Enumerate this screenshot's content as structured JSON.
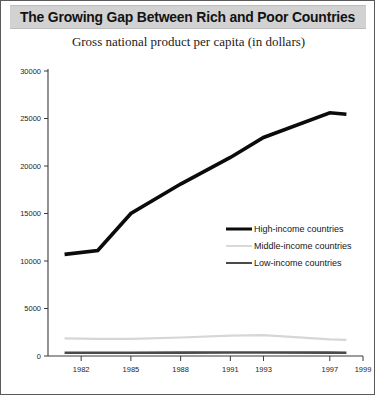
{
  "figure": {
    "title": "The Growing Gap Between Rich and Poor Countries",
    "subtitle": "Gross national product per capita (in dollars)"
  },
  "colors": {
    "title_band": "#d2d2d2",
    "frame": "#5a5a5a",
    "high_income": "#0b0b0b",
    "middle_income": "#d6d6d6",
    "low_income": "#4a4a4a"
  },
  "chart_data": {
    "type": "line",
    "title": "The Growing Gap Between Rich and Poor Countries",
    "subtitle": "Gross national product per capita (in dollars)",
    "xlabel": "",
    "ylabel": "",
    "xlim": [
      1980,
      1999
    ],
    "ylim": [
      0,
      30000
    ],
    "ytick_labels": [
      "0",
      "5000",
      "10000",
      "15000",
      "20000",
      "25000",
      "30000"
    ],
    "yticks": [
      0,
      5000,
      10000,
      15000,
      20000,
      25000,
      30000
    ],
    "xtick_labels": [
      "1982",
      "1985",
      "1988",
      "1991",
      "1993",
      "1997",
      "1999"
    ],
    "xticks": [
      1982,
      1985,
      1988,
      1991,
      1993,
      1997,
      1999
    ],
    "grid": false,
    "legend_position": "center right",
    "x": [
      1981,
      1983,
      1985,
      1988,
      1991,
      1993,
      1997,
      1998
    ],
    "series": [
      {
        "name": "High-income countries",
        "color": "#0b0b0b",
        "values": [
          10700,
          11100,
          15000,
          18100,
          20900,
          23000,
          25600,
          25450
        ]
      },
      {
        "name": "Middle-income countries",
        "color": "#d6d6d6",
        "values": [
          1850,
          1800,
          1800,
          1950,
          2150,
          2200,
          1750,
          1700
        ]
      },
      {
        "name": "Low-income countries",
        "color": "#4a4a4a",
        "values": [
          350,
          350,
          350,
          360,
          370,
          370,
          360,
          350
        ]
      }
    ]
  },
  "legend": {
    "items": [
      {
        "label": "High-income countries"
      },
      {
        "label": "Middle-income countries"
      },
      {
        "label": "Low-income countries"
      }
    ]
  }
}
